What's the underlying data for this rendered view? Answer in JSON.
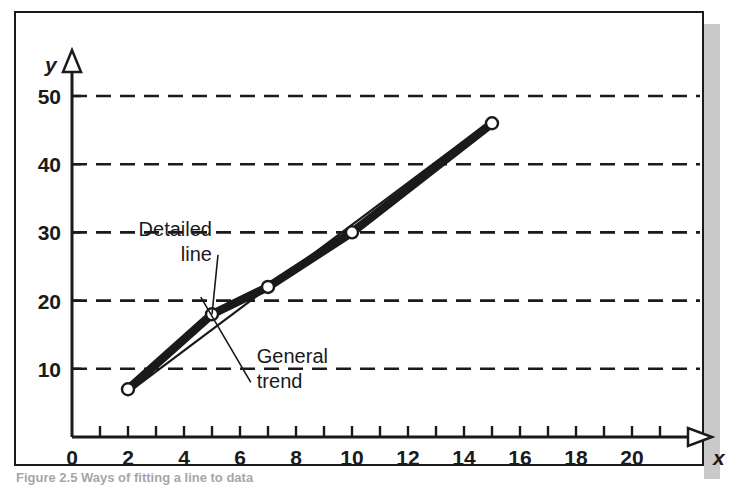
{
  "figure": {
    "caption": "Figure 2.5  Ways of fitting a line to data",
    "frame_color": "#1a1a1a",
    "shadow_color": "#c9c9c9",
    "background": "#ffffff"
  },
  "chart_data": {
    "type": "line",
    "title": "",
    "xlabel": "x",
    "ylabel": "y",
    "xlim": [
      0,
      21.5
    ],
    "ylim": [
      0,
      54
    ],
    "grid": true,
    "grid_orientation": "horizontal",
    "grid_style": "dashed",
    "legend": "none",
    "x_ticks_major": [
      0,
      2,
      4,
      6,
      8,
      10,
      12,
      14,
      16,
      18,
      20
    ],
    "x_ticks_minor": [
      1,
      3,
      5,
      7,
      9,
      11,
      13,
      15,
      17,
      19,
      21
    ],
    "x_tick_labels": [
      "0",
      "2",
      "4",
      "6",
      "8",
      "10",
      "12",
      "14",
      "16",
      "18",
      "20"
    ],
    "y_ticks": [
      10,
      20,
      30,
      40,
      50
    ],
    "y_tick_labels": [
      "10",
      "20",
      "30",
      "40",
      "50"
    ],
    "series": [
      {
        "name": "Detailed line",
        "style": "thick-solid-with-markers",
        "marker": "open-circle",
        "x": [
          2,
          5,
          7,
          10,
          15
        ],
        "values": [
          7,
          18,
          22,
          30,
          46
        ]
      },
      {
        "name": "General trend",
        "style": "thin-solid",
        "marker": "none",
        "x": [
          2,
          15
        ],
        "values": [
          6.5,
          46.5
        ]
      }
    ],
    "annotations": [
      {
        "id": "detailed-line",
        "lines": [
          "Detailed",
          "line"
        ],
        "align": "right",
        "text_x": 5.0,
        "text_y": 29.5,
        "leader_to_x": 5.0,
        "leader_to_y": 18.0
      },
      {
        "id": "general-trend",
        "lines": [
          "General",
          "trend"
        ],
        "align": "left",
        "text_x": 6.6,
        "text_y": 10.8,
        "leader_to_x": 4.6,
        "leader_to_y": 20.5
      }
    ]
  }
}
